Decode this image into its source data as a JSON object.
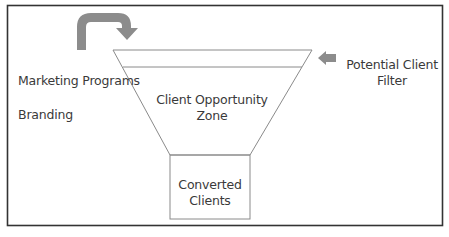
{
  "diagram": {
    "type": "sales-funnel",
    "labels": {
      "marketing_programs": "Marketing Programs",
      "branding": "Branding",
      "potential_client_filter_line1": "Potential Client",
      "potential_client_filter_line2": "Filter",
      "opportunity_zone_line1": "Client Opportunity",
      "opportunity_zone_line2": "Zone",
      "converted_line1": "Converted",
      "converted_line2": "Clients"
    },
    "colors": {
      "frame": "#333333",
      "funnel_stroke": "#8a8a8a",
      "arrow_fill": "#8c8c8c",
      "text": "#3a3a3a"
    }
  }
}
